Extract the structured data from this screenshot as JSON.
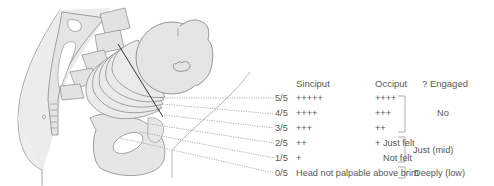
{
  "headers": {
    "sinciput": "Sinciput",
    "occiput": "Occiput",
    "engaged": "? Engaged"
  },
  "rows": [
    {
      "fifths": "5/5",
      "sinciput": "+++++",
      "occiput": "++++"
    },
    {
      "fifths": "4/5",
      "sinciput": "++++",
      "occiput": "+++"
    },
    {
      "fifths": "3/5",
      "sinciput": "+++",
      "occiput": "++"
    },
    {
      "fifths": "2/5",
      "sinciput": "++",
      "occiput": "+ Just felt"
    },
    {
      "fifths": "1/5",
      "sinciput": "+",
      "occiput": "Not felt"
    },
    {
      "fifths": "0/5",
      "sinciput": "Head not palpable above brim",
      "occiput": ""
    }
  ],
  "engagement": [
    {
      "label": "No",
      "rows": "5/5-3/5"
    },
    {
      "label": "Just (mid)",
      "rows": "2/5-1/5"
    },
    {
      "label": "Deeply (low)",
      "rows": "0/5"
    }
  ],
  "colors": {
    "outline": "#8a8a8a",
    "fill": "#e6e6e6",
    "dark_line": "#333333",
    "dotted": "#9a9a9a",
    "text": "#575757"
  }
}
